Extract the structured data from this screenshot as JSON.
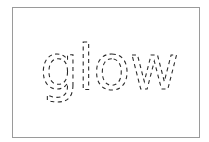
{
  "canvas": {
    "background": "#ffffff",
    "border_color": "#9a9a9a"
  },
  "artwork": {
    "word": "glow",
    "style": "dashed-outline",
    "stroke_color": "#2a2a2a"
  }
}
